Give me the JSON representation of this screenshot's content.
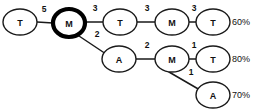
{
  "diagram": {
    "colors": {
      "background": "#ffffff",
      "stroke": "#1a1a1a",
      "highlight": "#000000",
      "text": "#111111"
    },
    "nodes": [
      {
        "id": "n1",
        "label": "T",
        "cx": 20,
        "cy": 22,
        "rx": 17,
        "ry": 13,
        "highlighted": false
      },
      {
        "id": "n2",
        "label": "M",
        "cx": 69,
        "cy": 23,
        "rx": 16,
        "ry": 14,
        "highlighted": true
      },
      {
        "id": "n3",
        "label": "T",
        "cx": 120,
        "cy": 22,
        "rx": 17,
        "ry": 13,
        "highlighted": false
      },
      {
        "id": "n4",
        "label": "M",
        "cx": 172,
        "cy": 22,
        "rx": 17,
        "ry": 13,
        "highlighted": false
      },
      {
        "id": "n5",
        "label": "T",
        "cx": 213,
        "cy": 22,
        "rx": 17,
        "ry": 13,
        "highlighted": false
      },
      {
        "id": "n6",
        "label": "A",
        "cx": 119,
        "cy": 59,
        "rx": 17,
        "ry": 13,
        "highlighted": false
      },
      {
        "id": "n7",
        "label": "M",
        "cx": 172,
        "cy": 59,
        "rx": 17,
        "ry": 13,
        "highlighted": false
      },
      {
        "id": "n8",
        "label": "T",
        "cx": 213,
        "cy": 59,
        "rx": 17,
        "ry": 13,
        "highlighted": false
      },
      {
        "id": "n9",
        "label": "A",
        "cx": 213,
        "cy": 95,
        "rx": 17,
        "ry": 13,
        "highlighted": false
      }
    ],
    "edges": [
      {
        "id": "e1",
        "from": "n1",
        "to": "n2",
        "weight": "5",
        "x1": 37,
        "y1": 22,
        "x2": 53,
        "y2": 23,
        "lx": 44,
        "ly": 12
      },
      {
        "id": "e2",
        "from": "n2",
        "to": "n3",
        "weight": "3",
        "x1": 85,
        "y1": 22,
        "x2": 103,
        "y2": 22,
        "lx": 95,
        "ly": 11
      },
      {
        "id": "e3",
        "from": "n3",
        "to": "n4",
        "weight": "3",
        "x1": 137,
        "y1": 22,
        "x2": 155,
        "y2": 22,
        "lx": 147,
        "ly": 11
      },
      {
        "id": "e4",
        "from": "n4",
        "to": "n5",
        "weight": "3",
        "x1": 189,
        "y1": 22,
        "x2": 196,
        "y2": 22,
        "lx": 194,
        "ly": 11
      },
      {
        "id": "e5",
        "from": "n2",
        "to": "n6",
        "weight": "2",
        "x1": 76,
        "y1": 34,
        "x2": 106,
        "y2": 54,
        "lx": 97,
        "ly": 37
      },
      {
        "id": "e6",
        "from": "n6",
        "to": "n7",
        "weight": "2",
        "x1": 136,
        "y1": 59,
        "x2": 155,
        "y2": 59,
        "lx": 147,
        "ly": 48
      },
      {
        "id": "e7",
        "from": "n7",
        "to": "n8",
        "weight": "1",
        "x1": 189,
        "y1": 59,
        "x2": 196,
        "y2": 59,
        "lx": 194,
        "ly": 48
      },
      {
        "id": "e8",
        "from": "n7",
        "to": "n9",
        "weight": "1",
        "x1": 169,
        "y1": 72,
        "x2": 200,
        "y2": 90,
        "lx": 191,
        "ly": 75
      }
    ],
    "outcomes": [
      {
        "id": "o1",
        "for": "n5",
        "value": "60%",
        "x": 232,
        "y": 22
      },
      {
        "id": "o2",
        "for": "n8",
        "value": "80%",
        "x": 232,
        "y": 59
      },
      {
        "id": "o3",
        "for": "n9",
        "value": "70%",
        "x": 232,
        "y": 95
      }
    ]
  }
}
